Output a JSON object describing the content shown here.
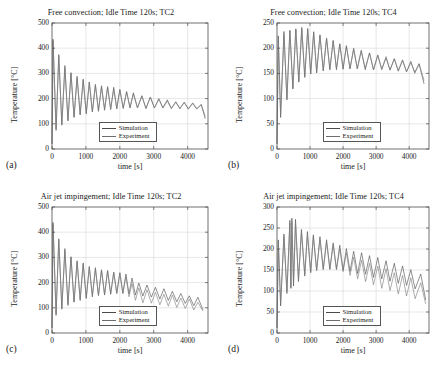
{
  "figure": {
    "panels": [
      {
        "tag": "(a)",
        "title": "Free convection; Idle Time 120s; TC2",
        "xlabel": "time [s]",
        "ylabel": "Temperature [°C]",
        "xticks": [
          "0",
          "1000",
          "2000",
          "3000",
          "4000"
        ],
        "yticks": [
          "0",
          "100",
          "200",
          "300",
          "400",
          "500"
        ],
        "legend": [
          "Simulation",
          "Experiment"
        ]
      },
      {
        "tag": "(b)",
        "title": "Free convection; Idle Time 120s; TC4",
        "xlabel": "time [s]",
        "ylabel": "Temperature [°C]",
        "xticks": [
          "0",
          "1000",
          "2000",
          "3000",
          "4000"
        ],
        "yticks": [
          "0",
          "50",
          "100",
          "150",
          "200",
          "250"
        ],
        "legend": [
          "Simulation",
          "Experiment"
        ]
      },
      {
        "tag": "(c)",
        "title": "Air jet impingement; Idle Time 120s; TC2",
        "xlabel": "time [s]",
        "ylabel": "Temperature [°C]",
        "xticks": [
          "0",
          "1000",
          "2000",
          "3000",
          "4000"
        ],
        "yticks": [
          "0",
          "100",
          "200",
          "300",
          "400",
          "500"
        ],
        "legend": [
          "Simulation",
          "Experiment"
        ]
      },
      {
        "tag": "(d)",
        "title": "Air jet impingement; Idle Time 120s; TC4",
        "xlabel": "time [s]",
        "ylabel": "Temperature [°C]",
        "xticks": [
          "0",
          "1000",
          "2000",
          "3000",
          "4000"
        ],
        "yticks": [
          "0",
          "50",
          "100",
          "150",
          "200",
          "250",
          "300"
        ],
        "legend": [
          "Simulation",
          "Experiment"
        ]
      }
    ]
  },
  "colors": {
    "simulation": "#4a4a4a",
    "experiment": "#7b7b7b",
    "axis": "#4d4d4d",
    "grid": "#cfcfcf",
    "text": "#1a1a1a"
  },
  "chart_data": [
    {
      "type": "line",
      "panel": "(a)",
      "title": "Free convection; Idle Time 120s; TC2",
      "xlabel": "time [s]",
      "ylabel": "Temperature [°C]",
      "xlim": [
        0,
        4600
      ],
      "ylim": [
        0,
        500
      ],
      "xticks": [
        0,
        1000,
        2000,
        3000,
        4000
      ],
      "yticks": [
        0,
        100,
        200,
        300,
        400,
        500
      ],
      "grid": true,
      "legend_position": "lower-center",
      "series": [
        {
          "name": "Simulation",
          "description": "Sawtooth thermal cycling: rapid rise to first peak 437 C at t=30 s, crash to 72 C, subsequent peaks decay 375, 330, 300, 285, 270, 258, 250 ... settling near 185 C; troughs rise 72, 95, 112, 128, 140, 150 ... to about 155 C. Oscillation amplitude shrinks from 365 C to under 20 C by t=3500 s; final segment after t=4400 s drops to 122 C.",
          "peaks_t": [
            30,
            200,
            380,
            560,
            740,
            920,
            1100,
            1280,
            1460,
            1640,
            1820,
            2000,
            2200,
            2400,
            2650,
            2900,
            3150,
            3400,
            3650,
            3900,
            4150,
            4400
          ],
          "peaks_y": [
            437,
            375,
            330,
            303,
            288,
            275,
            265,
            258,
            252,
            247,
            242,
            237,
            230,
            222,
            214,
            206,
            199,
            193,
            188,
            183,
            180,
            178
          ],
          "troughs_t": [
            120,
            290,
            470,
            650,
            830,
            1010,
            1190,
            1370,
            1550,
            1730,
            1910,
            2100,
            2300,
            2520,
            2770,
            3020,
            3270,
            3520,
            3770,
            4020,
            4270,
            4520
          ],
          "troughs_y": [
            72,
            95,
            112,
            124,
            133,
            140,
            146,
            151,
            155,
            158,
            160,
            161,
            162,
            162,
            162,
            161,
            161,
            160,
            160,
            159,
            158,
            122
          ]
        },
        {
          "name": "Experiment",
          "description": "Nearly overlapping the simulation trace for the whole record, peaks running 5-12 C lower in the first 1000 s and tracking within a few degrees thereafter.",
          "peaks_t": [
            30,
            200,
            380,
            560,
            740,
            920,
            1100,
            1280,
            1460,
            1640,
            1820,
            2000,
            2200,
            2400,
            2650,
            2900,
            3150,
            3400,
            3650,
            3900,
            4150,
            4400
          ],
          "peaks_y": [
            430,
            366,
            322,
            297,
            282,
            270,
            261,
            254,
            248,
            243,
            238,
            234,
            227,
            219,
            211,
            204,
            197,
            191,
            186,
            182,
            179,
            176
          ],
          "troughs_t": [
            120,
            290,
            470,
            650,
            830,
            1010,
            1190,
            1370,
            1550,
            1730,
            1910,
            2100,
            2300,
            2520,
            2770,
            3020,
            3270,
            3520,
            3770,
            4020,
            4270,
            4520
          ],
          "troughs_y": [
            80,
            100,
            116,
            127,
            136,
            143,
            148,
            153,
            157,
            159,
            161,
            162,
            163,
            163,
            163,
            162,
            162,
            161,
            160,
            159,
            158,
            130
          ]
        }
      ]
    },
    {
      "type": "line",
      "panel": "(b)",
      "title": "Free convection; Idle Time 120s; TC4",
      "xlabel": "time [s]",
      "ylabel": "Temperature [°C]",
      "xlim": [
        0,
        4600
      ],
      "ylim": [
        0,
        250
      ],
      "xticks": [
        0,
        1000,
        2000,
        3000,
        4000
      ],
      "yticks": [
        0,
        50,
        100,
        150,
        200,
        250
      ],
      "grid": true,
      "legend_position": "lower-center",
      "series": [
        {
          "name": "Simulation",
          "description": "Starts at 20 C, first peak 225 C at t=40 s, dips to 62 C, then peaks climb to a maximum of about 240 C near t=700-900 s before decaying slowly to 165 C; troughs rise from 62 C to about 150 C. Amplitude narrows steadily; tail after t=4300 s falls to 130 C.",
          "peaks_t": [
            40,
            210,
            390,
            570,
            750,
            930,
            1110,
            1300,
            1500,
            1700,
            1900,
            2100,
            2320,
            2550,
            2800,
            3050,
            3300,
            3550,
            3800,
            4050,
            4300
          ],
          "peaks_y": [
            225,
            232,
            236,
            239,
            240,
            238,
            233,
            227,
            221,
            215,
            210,
            205,
            200,
            195,
            190,
            186,
            182,
            179,
            176,
            173,
            170
          ],
          "troughs_t": [
            110,
            300,
            480,
            660,
            840,
            1020,
            1200,
            1400,
            1600,
            1800,
            2000,
            2210,
            2430,
            2670,
            2920,
            3170,
            3420,
            3670,
            3920,
            4170,
            4450
          ],
          "troughs_y": [
            62,
            96,
            118,
            132,
            142,
            148,
            152,
            155,
            157,
            158,
            159,
            159,
            159,
            158,
            158,
            157,
            156,
            155,
            154,
            152,
            130
          ]
        },
        {
          "name": "Experiment",
          "description": "Overlaps the simulation closely throughout; early peaks slightly lower and troughs slightly higher, converging after t=1500 s.",
          "peaks_t": [
            40,
            210,
            390,
            570,
            750,
            930,
            1110,
            1300,
            1500,
            1700,
            1900,
            2100,
            2320,
            2550,
            2800,
            3050,
            3300,
            3550,
            3800,
            4050,
            4300
          ],
          "peaks_y": [
            218,
            228,
            233,
            236,
            237,
            235,
            231,
            225,
            219,
            214,
            209,
            204,
            199,
            194,
            190,
            186,
            182,
            179,
            176,
            173,
            169
          ],
          "troughs_t": [
            110,
            300,
            480,
            660,
            840,
            1020,
            1200,
            1400,
            1600,
            1800,
            2000,
            2210,
            2430,
            2670,
            2920,
            3170,
            3420,
            3670,
            3920,
            4170,
            4450
          ],
          "troughs_y": [
            70,
            102,
            122,
            135,
            144,
            150,
            154,
            156,
            158,
            159,
            160,
            160,
            159,
            159,
            158,
            157,
            156,
            155,
            153,
            151,
            135
          ]
        }
      ]
    },
    {
      "type": "line",
      "panel": "(c)",
      "title": "Air jet impingement; Idle Time 120s; TC2",
      "xlabel": "time [s]",
      "ylabel": "Temperature [°C]",
      "xlim": [
        0,
        4600
      ],
      "ylim": [
        0,
        500
      ],
      "xticks": [
        0,
        1000,
        2000,
        3000,
        4000
      ],
      "yticks": [
        0,
        100,
        200,
        300,
        400,
        500
      ],
      "grid": true,
      "legend_position": "lower-center",
      "series": [
        {
          "name": "Simulation",
          "description": "First peak 440 C at t=30 s, trough 70 C, peaks decay 375, 330, 300, 280, 268, 258, 250 settling near 215 C through t=2300 s, then a steady downward drift to 120 C at the end; troughs rise to about 160 C by t=2000 s then fall back toward 95 C.",
          "peaks_t": [
            30,
            200,
            380,
            560,
            740,
            920,
            1100,
            1280,
            1460,
            1640,
            1820,
            2000,
            2180,
            2360,
            2560,
            2800,
            3050,
            3300,
            3550,
            3800,
            4050,
            4300
          ],
          "peaks_y": [
            440,
            375,
            332,
            305,
            288,
            276,
            266,
            259,
            253,
            248,
            244,
            240,
            232,
            215,
            200,
            190,
            181,
            173,
            166,
            158,
            150,
            140
          ],
          "troughs_t": [
            120,
            290,
            470,
            650,
            830,
            1010,
            1190,
            1370,
            1550,
            1730,
            1910,
            2090,
            2270,
            2460,
            2680,
            2930,
            3180,
            3430,
            3680,
            3930,
            4180,
            4450
          ],
          "troughs_y": [
            70,
            94,
            110,
            122,
            131,
            138,
            144,
            149,
            152,
            155,
            157,
            158,
            155,
            150,
            145,
            140,
            134,
            128,
            122,
            116,
            108,
            95
          ]
        },
        {
          "name": "Experiment",
          "description": "Tracks the simulation until about t=2300 s, after which it separates downward and runs roughly 30-45 C below the simulation band, ending near 90 C.",
          "peaks_t": [
            30,
            200,
            380,
            560,
            740,
            920,
            1100,
            1280,
            1460,
            1640,
            1820,
            2000,
            2180,
            2360,
            2560,
            2800,
            3050,
            3300,
            3550,
            3800,
            4050,
            4300
          ],
          "peaks_y": [
            432,
            368,
            325,
            299,
            283,
            271,
            262,
            255,
            250,
            245,
            241,
            237,
            225,
            196,
            180,
            170,
            162,
            155,
            148,
            141,
            133,
            124
          ],
          "troughs_t": [
            120,
            290,
            470,
            650,
            830,
            1010,
            1190,
            1370,
            1550,
            1730,
            1910,
            2090,
            2270,
            2460,
            2680,
            2930,
            3180,
            3430,
            3680,
            3930,
            4180,
            4450
          ],
          "troughs_y": [
            78,
            99,
            114,
            125,
            134,
            141,
            146,
            150,
            153,
            156,
            157,
            157,
            145,
            130,
            122,
            117,
            112,
            107,
            102,
            98,
            93,
            88
          ]
        }
      ]
    },
    {
      "type": "line",
      "panel": "(d)",
      "title": "Air jet impingement; Idle Time 120s; TC4",
      "xlabel": "time [s]",
      "ylabel": "Temperature [°C]",
      "xlim": [
        0,
        4600
      ],
      "ylim": [
        0,
        300
      ],
      "xticks": [
        0,
        1000,
        2000,
        3000,
        4000
      ],
      "yticks": [
        0,
        50,
        100,
        150,
        200,
        250,
        300
      ],
      "grid": true,
      "legend_position": "lower-center",
      "series": [
        {
          "name": "Simulation",
          "description": "Rises from 20 C, first peak 222 C at t=40 s, trough 65 C, peaks grow to a maximum of 272 C around t=450-560 s then decay steadily to about 135 C; troughs rise to 150 C near t=1800 s then fall to about 80 C at the end.",
          "peaks_t": [
            40,
            210,
            390,
            450,
            560,
            740,
            920,
            1100,
            1300,
            1500,
            1700,
            1900,
            2100,
            2320,
            2560,
            2800,
            3050,
            3300,
            3550,
            3800,
            4050,
            4350
          ],
          "peaks_y": [
            222,
            235,
            268,
            272,
            270,
            245,
            240,
            233,
            228,
            222,
            216,
            210,
            202,
            196,
            190,
            184,
            178,
            172,
            166,
            160,
            152,
            142
          ],
          "troughs_t": [
            110,
            300,
            420,
            500,
            650,
            840,
            1020,
            1200,
            1400,
            1600,
            1800,
            2000,
            2210,
            2440,
            2680,
            2920,
            3170,
            3420,
            3670,
            3920,
            4180,
            4500
          ],
          "troughs_y": [
            65,
            95,
            105,
            112,
            122,
            135,
            143,
            148,
            151,
            152,
            152,
            150,
            147,
            143,
            139,
            134,
            129,
            124,
            118,
            112,
            104,
            80
          ]
        },
        {
          "name": "Experiment",
          "description": "Matches the simulation envelope through the first 2000 s, then drifts lower by roughly 25-40 C; its troughs dive well below the simulation after t=2400 s, finishing near 75 C.",
          "peaks_t": [
            40,
            210,
            390,
            450,
            560,
            740,
            920,
            1100,
            1300,
            1500,
            1700,
            1900,
            2100,
            2320,
            2560,
            2800,
            3050,
            3300,
            3550,
            3800,
            4050,
            4350
          ],
          "peaks_y": [
            215,
            228,
            262,
            266,
            264,
            239,
            234,
            228,
            222,
            216,
            209,
            202,
            190,
            180,
            172,
            165,
            158,
            152,
            145,
            138,
            130,
            120
          ],
          "troughs_t": [
            110,
            300,
            420,
            500,
            650,
            840,
            1020,
            1200,
            1400,
            1600,
            1800,
            2000,
            2210,
            2440,
            2680,
            2920,
            3170,
            3420,
            3670,
            3920,
            4180,
            4500
          ],
          "troughs_y": [
            72,
            100,
            110,
            117,
            127,
            139,
            146,
            150,
            152,
            152,
            150,
            146,
            138,
            128,
            121,
            114,
            107,
            100,
            94,
            88,
            82,
            70
          ]
        }
      ]
    }
  ]
}
